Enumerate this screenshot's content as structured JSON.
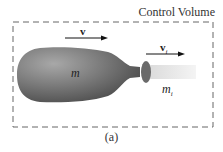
{
  "diagram": {
    "title": "Control Volume",
    "caption": "(a)",
    "labels": {
      "velocity_body": "v",
      "velocity_jet": "v",
      "velocity_jet_sub": "i",
      "mass_body": "m",
      "mass_jet": "m",
      "mass_jet_sub": "i"
    },
    "colors": {
      "body": "#6e6e6e",
      "boundary": "#666666",
      "jet": "#e6e6e6"
    }
  }
}
